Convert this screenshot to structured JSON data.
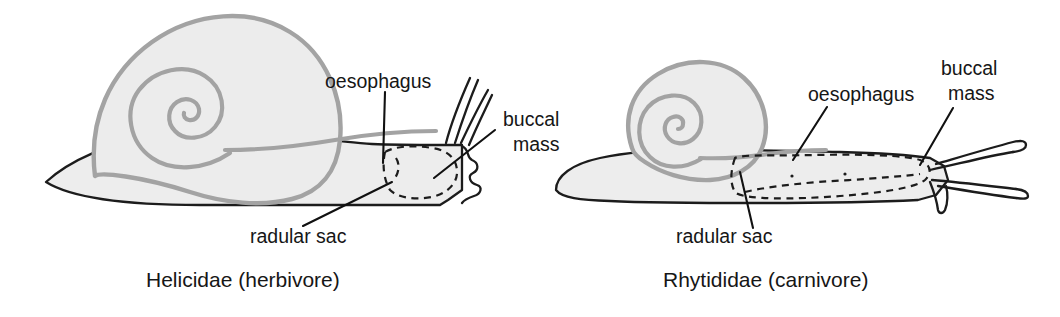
{
  "figure": {
    "background_color": "#ffffff",
    "line_color": "#1c1c1c",
    "shell_color": "#a3a3a3",
    "fill_color": "#ededed"
  },
  "panels": [
    {
      "id": "helicidae",
      "caption": "Helicidae (herbivore)",
      "labels": {
        "oesophagus": "oesophagus",
        "buccal_mass_line1": "buccal",
        "buccal_mass_line2": "mass",
        "radular_sac": "radular sac"
      }
    },
    {
      "id": "rhytididae",
      "caption": "Rhytididae (carnivore)",
      "labels": {
        "oesophagus": "oesophagus",
        "buccal_mass_line1": "buccal",
        "buccal_mass_line2": "mass",
        "radular_sac": "radular sac"
      }
    }
  ]
}
